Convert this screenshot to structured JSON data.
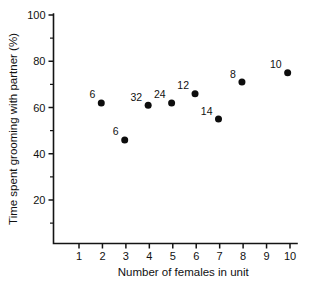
{
  "chart_data": {
    "type": "scatter",
    "title": "",
    "xlabel": "Number of females in unit",
    "ylabel": "Time spent grooming with partner (%)",
    "xlim": [
      0.6,
      10.4
    ],
    "ylim": [
      10,
      100
    ],
    "grid": false,
    "legend": "none",
    "x_ticks": [
      1,
      2,
      3,
      4,
      5,
      6,
      7,
      8,
      9,
      10
    ],
    "y_ticks": [
      20,
      40,
      60,
      80,
      100
    ],
    "y_minor_ticks": [
      10,
      30,
      50,
      70,
      90
    ],
    "x_tick_labels": [
      "1",
      "2",
      "3",
      "4",
      "5",
      "6",
      "7",
      "8",
      "9",
      "10"
    ],
    "y_tick_labels": [
      "20",
      "40",
      "60",
      "80",
      "100"
    ],
    "points": [
      {
        "x": 1.95,
        "y": 62,
        "label": "6"
      },
      {
        "x": 2.95,
        "y": 46,
        "label": "6"
      },
      {
        "x": 3.95,
        "y": 61,
        "label": "32"
      },
      {
        "x": 4.95,
        "y": 62,
        "label": "24"
      },
      {
        "x": 5.95,
        "y": 66,
        "label": "12"
      },
      {
        "x": 6.95,
        "y": 55,
        "label": "14"
      },
      {
        "x": 7.95,
        "y": 71,
        "label": "8"
      },
      {
        "x": 9.9,
        "y": 75,
        "label": "10"
      }
    ],
    "marker_color": "#0d0d0d",
    "axis_color": "#141414"
  }
}
